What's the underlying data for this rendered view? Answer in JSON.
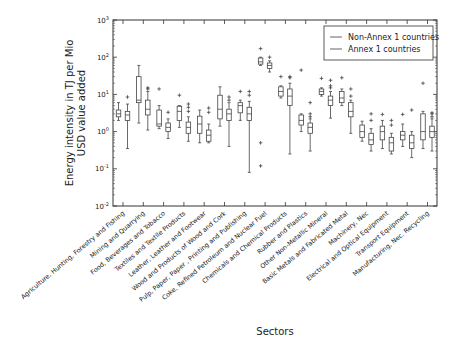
{
  "chart_data": {
    "type": "box",
    "title": "",
    "xlabel": "Sectors",
    "ylabel": "Energy intensity in TJ per Mio USD value added",
    "ylabel_lines": [
      "Energy intensity in TJ per Mio",
      "USD value added"
    ],
    "yscale": "log",
    "ylim": [
      0.01,
      1000
    ],
    "yticks": [
      {
        "exp": "-2",
        "value": 0.01
      },
      {
        "exp": "-1",
        "value": 0.1
      },
      {
        "exp": "0",
        "value": 1
      },
      {
        "exp": "1",
        "value": 10
      },
      {
        "exp": "2",
        "value": 100
      },
      {
        "exp": "3",
        "value": 1000
      }
    ],
    "grid": false,
    "legend": {
      "position": "upper right",
      "entries": [
        "Non-Annex 1 countries",
        "Annex 1 countries"
      ]
    },
    "categories": [
      "Agriculture, Hunting, Forestry and Fishing",
      "Mining and Quarrying",
      "Food, Beverages and Tobacco",
      "Textiles and Textile Products",
      "Leather, Leather and Footwear",
      "Wood and Products of Wood and Cork",
      "Pulp, Paper, Paper , Printing and Publishing",
      "Coke, Refined Petroleum and Nuclear Fuel",
      "Chemicals and Chemical Products",
      "Rubber and Plastics",
      "Other Non-Metallic Mineral",
      "Basic Metals and Fabricated Metal",
      "Machinery, Nec",
      "Electrical and Optical Equipment",
      "Transport Equipment",
      "Manufacturing, Nec. Recycling"
    ],
    "series": [
      {
        "name": "Non-Annex 1 countries",
        "boxes": [
          {
            "whislo": 2.0,
            "q1": 2.5,
            "med": 3.0,
            "q3": 3.8,
            "whishi": 6.0,
            "fliers": []
          },
          {
            "whislo": 1.7,
            "q1": 6.0,
            "med": 7.0,
            "q3": 30.0,
            "whishi": 60.0,
            "fliers": []
          },
          {
            "whislo": 1.2,
            "q1": 1.4,
            "med": 1.6,
            "q3": 3.8,
            "whishi": 5.0,
            "fliers": [
              14
            ]
          },
          {
            "whislo": 1.3,
            "q1": 2.0,
            "med": 3.5,
            "q3": 4.8,
            "whishi": 5.0,
            "fliers": [
              9.5
            ]
          },
          {
            "whislo": 0.5,
            "q1": 0.9,
            "med": 1.6,
            "q3": 2.6,
            "whishi": 3.8,
            "fliers": []
          },
          {
            "whislo": 1.4,
            "q1": 2.2,
            "med": 4.0,
            "q3": 9.5,
            "whishi": 16.0,
            "fliers": []
          },
          {
            "whislo": 2.0,
            "q1": 3.2,
            "med": 5.0,
            "q3": 6.0,
            "whishi": 7.0,
            "fliers": [
              12
            ]
          },
          {
            "whislo": 60.0,
            "q1": 65.0,
            "med": 75.0,
            "q3": 95.0,
            "whishi": 100.0,
            "fliers": [
              170,
              0.5,
              0.12
            ]
          },
          {
            "whislo": 8.0,
            "q1": 9.0,
            "med": 12.0,
            "q3": 16.0,
            "whishi": 17.0,
            "fliers": [
              30
            ]
          },
          {
            "whislo": 1.0,
            "q1": 1.5,
            "med": 2.0,
            "q3": 2.8,
            "whishi": 3.0,
            "fliers": [
              45
            ]
          },
          {
            "whislo": 9.0,
            "q1": 10.0,
            "med": 12.0,
            "q3": 14.0,
            "whishi": 15.0,
            "fliers": [
              27
            ]
          },
          {
            "whislo": 5.0,
            "q1": 6.0,
            "med": 8.0,
            "q3": 12.0,
            "whishi": 14.0,
            "fliers": [
              28
            ]
          },
          {
            "whislo": 0.55,
            "q1": 0.7,
            "med": 1.0,
            "q3": 1.5,
            "whishi": 1.9,
            "fliers": []
          },
          {
            "whislo": 0.35,
            "q1": 0.6,
            "med": 1.0,
            "q3": 1.4,
            "whishi": 2.0,
            "fliers": [
              2.9
            ]
          },
          {
            "whislo": 0.4,
            "q1": 0.6,
            "med": 0.8,
            "q3": 1.0,
            "whishi": 1.6,
            "fliers": [
              2.9
            ]
          },
          {
            "whislo": 0.35,
            "q1": 0.6,
            "med": 1.0,
            "q3": 3.0,
            "whishi": 3.5,
            "fliers": [
              20
            ]
          }
        ]
      },
      {
        "name": "Annex 1 countries",
        "boxes": [
          {
            "whislo": 0.35,
            "q1": 2.0,
            "med": 2.8,
            "q3": 3.5,
            "whishi": 5.5,
            "fliers": [
              8.5
            ]
          },
          {
            "whislo": 1.1,
            "q1": 2.8,
            "med": 4.0,
            "q3": 7.0,
            "whishi": 12.0,
            "fliers": [
              14,
              15
            ]
          },
          {
            "whislo": 0.65,
            "q1": 1.0,
            "med": 1.3,
            "q3": 1.7,
            "whishi": 2.2,
            "fliers": [
              3.3
            ]
          },
          {
            "whislo": 0.55,
            "q1": 0.9,
            "med": 1.3,
            "q3": 1.8,
            "whishi": 2.5,
            "fliers": [
              3.5,
              4.5,
              5.5
            ]
          },
          {
            "whislo": 0.5,
            "q1": 0.55,
            "med": 0.8,
            "q3": 1.1,
            "whishi": 1.6,
            "fliers": [
              3.3,
              4.3
            ]
          },
          {
            "whislo": 0.4,
            "q1": 2.0,
            "med": 3.0,
            "q3": 4.0,
            "whishi": 6.0,
            "fliers": [
              7.0,
              8.5
            ]
          },
          {
            "whislo": 0.08,
            "q1": 2.0,
            "med": 3.0,
            "q3": 4.5,
            "whishi": 6.5,
            "fliers": [
              9.5,
              12
            ]
          },
          {
            "whislo": 40.0,
            "q1": 50.0,
            "med": 60.0,
            "q3": 70.0,
            "whishi": 80.0,
            "fliers": [
              100
            ]
          },
          {
            "whislo": 0.25,
            "q1": 5.0,
            "med": 9.0,
            "q3": 14.0,
            "whishi": 20.0,
            "fliers": [
              28,
              30
            ]
          },
          {
            "whislo": 0.3,
            "q1": 0.9,
            "med": 1.3,
            "q3": 1.7,
            "whishi": 2.2,
            "fliers": [
              2.5,
              3.0,
              6.0
            ]
          },
          {
            "whislo": 2.3,
            "q1": 5.0,
            "med": 7.0,
            "q3": 9.0,
            "whishi": 12.0,
            "fliers": [
              15,
              17,
              24
            ]
          },
          {
            "whislo": 0.9,
            "q1": 2.5,
            "med": 3.5,
            "q3": 6.0,
            "whishi": 7.0,
            "fliers": [
              9,
              14
            ]
          },
          {
            "whislo": 0.3,
            "q1": 0.45,
            "med": 0.6,
            "q3": 0.9,
            "whishi": 1.2,
            "fliers": [
              2.0,
              3.0
            ]
          },
          {
            "whislo": 0.25,
            "q1": 0.3,
            "med": 0.5,
            "q3": 0.7,
            "whishi": 0.9,
            "fliers": [
              1.5,
              2.0
            ]
          },
          {
            "whislo": 0.2,
            "q1": 0.35,
            "med": 0.5,
            "q3": 0.8,
            "whishi": 1.0,
            "fliers": [
              3.8
            ]
          },
          {
            "whislo": 0.3,
            "q1": 0.7,
            "med": 1.0,
            "q3": 1.4,
            "whishi": 2.2,
            "fliers": [
              2.5,
              3.0,
              3.2
            ]
          }
        ]
      }
    ]
  }
}
